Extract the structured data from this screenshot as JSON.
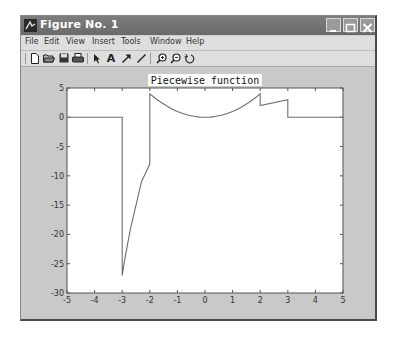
{
  "window": {
    "title": "Figure No. 1",
    "controls": {
      "minimize": "minimize",
      "maximize": "maximize",
      "close": "close"
    }
  },
  "menubar": {
    "items": [
      "File",
      "Edit",
      "View",
      "Insert",
      "Tools",
      "Window",
      "Help"
    ]
  },
  "toolbar": {
    "buttons": [
      {
        "name": "new-figure",
        "icon": "new-file-icon"
      },
      {
        "name": "open",
        "icon": "open-folder-icon"
      },
      {
        "name": "save",
        "icon": "save-icon"
      },
      {
        "name": "print",
        "icon": "print-icon"
      },
      {
        "name": "edit-plot",
        "icon": "arrow-pointer-icon"
      },
      {
        "name": "insert-text",
        "icon": "text-icon"
      },
      {
        "name": "insert-arrow",
        "icon": "arrow-icon"
      },
      {
        "name": "insert-line",
        "icon": "line-icon"
      },
      {
        "name": "zoom-in",
        "icon": "zoom-in-icon"
      },
      {
        "name": "zoom-out",
        "icon": "zoom-out-icon"
      },
      {
        "name": "rotate-3d",
        "icon": "rotate-icon"
      }
    ]
  },
  "chart_data": {
    "type": "line",
    "title": "Piecewise function",
    "xlabel": "",
    "ylabel": "",
    "xlim": [
      -5,
      5
    ],
    "ylim": [
      -30,
      5
    ],
    "xticks": [
      -5,
      -4,
      -3,
      -2,
      -1,
      0,
      1,
      2,
      3,
      4,
      5
    ],
    "yticks": [
      5,
      0,
      -5,
      -10,
      -15,
      -20,
      -25,
      -30
    ],
    "grid": false,
    "legend": null,
    "series": [
      {
        "name": "piecewise",
        "color": "#6e6e6e",
        "x": [
          -5,
          -3,
          -3,
          -2.9,
          -2.7,
          -2.5,
          -2.3,
          -2.1,
          -2,
          -2,
          -1.8,
          -1.6,
          -1.4,
          -1.2,
          -1,
          -0.8,
          -0.6,
          -0.4,
          -0.2,
          0,
          0.2,
          0.4,
          0.6,
          0.8,
          1,
          1.2,
          1.4,
          1.6,
          1.8,
          2,
          2,
          3,
          3,
          5
        ],
        "y": [
          0,
          0,
          -27,
          -24,
          -19,
          -15,
          -11,
          -9,
          -8,
          4,
          3.24,
          2.56,
          1.96,
          1.44,
          1,
          0.64,
          0.36,
          0.16,
          0.04,
          0,
          0.04,
          0.16,
          0.36,
          0.64,
          1,
          1.44,
          1.96,
          2.56,
          3.24,
          4,
          2,
          3,
          0,
          0
        ]
      }
    ]
  }
}
